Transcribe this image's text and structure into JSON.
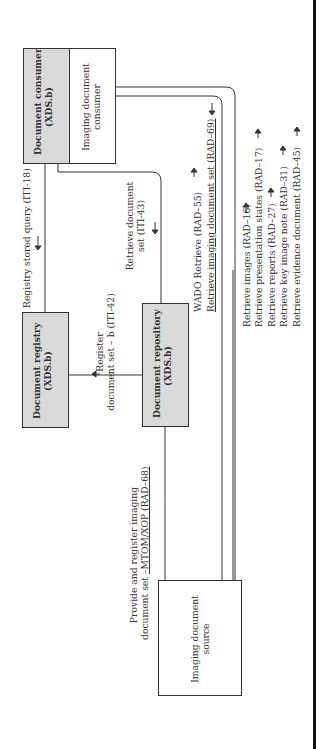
{
  "diagram": {
    "actors": {
      "document_consumer": {
        "title": "Document consumer",
        "subtitle": "(XDS.b)"
      },
      "imaging_document_consumer": {
        "line1": "Imaging document",
        "line2": "consumer"
      },
      "document_registry": {
        "title": "Document registry",
        "subtitle": "(XDS.b)"
      },
      "document_repository": {
        "title": "Document repository",
        "subtitle": "(XDS.b)"
      },
      "imaging_document_source": {
        "line1": "Imaging document",
        "line2": "source"
      }
    },
    "transactions": {
      "registry_stored_query": "Registry stored query (ITI-18)",
      "register_line1": "Register",
      "register_line2": "document set – b (ITI-42)",
      "retrieve_doc_set_line1": "Retrieve document",
      "retrieve_doc_set_line2": "set (ITI-43)",
      "wado_retrieve": "WADO Retrieve (RAD–55)",
      "retrieve_imaging_doc_set": "Retrieve imaging document set (RAD–69)",
      "provide_register_line1": "Provide and register imaging",
      "provide_register_line2_plain": "document set ",
      "provide_register_line2_underlined": "–MTOM/XOP (RAD–68)",
      "retrieve_list": [
        "Retrieve images (RAD–16)",
        "Retrieve presentation states (RAD–17)",
        "Retrieve reports (RAD–27)",
        "Retrieve key image note (RAD–31)",
        "Retrieve evidence document (RAD–45)"
      ]
    },
    "colors": {
      "gray_box": "#d9d9d9",
      "line": "#333333"
    }
  }
}
